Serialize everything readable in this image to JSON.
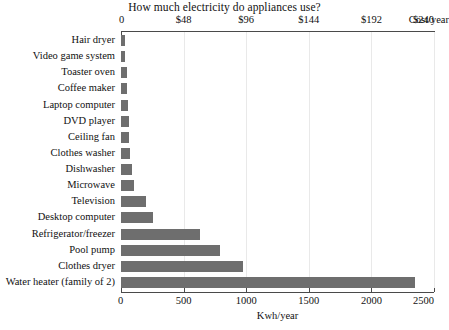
{
  "chart_data": {
    "type": "bar",
    "orientation": "horizontal",
    "title": "How much electricity do appliances use?",
    "xlabel": "Kwh/year",
    "ylabel": "",
    "secondary_axis_label": "Cost/year",
    "xlim": [
      0,
      2500
    ],
    "xticks": [
      0,
      500,
      1000,
      1500,
      2000,
      2500
    ],
    "xticklabels": [
      "0",
      "500",
      "1000",
      "1500",
      "2000",
      "2500"
    ],
    "secondary_xticks": [
      0,
      48,
      96,
      144,
      192,
      240
    ],
    "secondary_xticklabels": [
      "0",
      "$48",
      "$96",
      "$144",
      "$192",
      "$240"
    ],
    "grid": true,
    "legend": false,
    "bar_color": "#6e6e6e",
    "axis_color": "#4a4a4a",
    "categories": [
      "Hair dryer",
      "Video game system",
      "Toaster oven",
      "Coffee maker",
      "Laptop computer",
      "DVD player",
      "Ceiling fan",
      "Clothes washer",
      "Dishwasher",
      "Microwave",
      "Television",
      "Desktop computer",
      "Refrigerator/freezer",
      "Pool pump",
      "Clothes dryer",
      "Water heater (family of 2)"
    ],
    "values": [
      30,
      35,
      45,
      50,
      55,
      60,
      65,
      75,
      90,
      100,
      200,
      255,
      630,
      790,
      975,
      2350
    ]
  }
}
